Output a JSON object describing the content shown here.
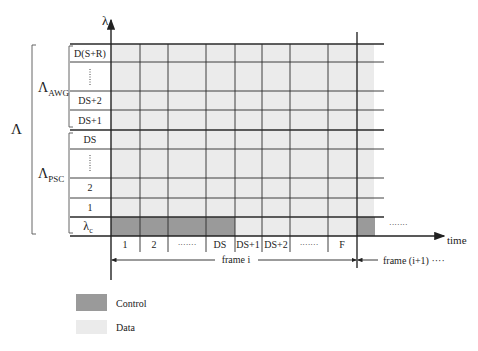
{
  "axes": {
    "y_label": "λ",
    "x_label": "time"
  },
  "groups": {
    "outer": "Λ",
    "awg": {
      "main": "Λ",
      "sub": "AWG"
    },
    "psc": {
      "main": "Λ",
      "sub": "PSC"
    }
  },
  "rows": [
    {
      "label": "D(S+R)",
      "dots": false
    },
    {
      "label": "",
      "dots": true
    },
    {
      "label": "DS+2",
      "dots": false
    },
    {
      "label": "DS+1",
      "dots": false
    },
    {
      "label": "DS",
      "dots": false
    },
    {
      "label": "",
      "dots": true
    },
    {
      "label": "2",
      "dots": false
    },
    {
      "label": "1",
      "dots": false
    },
    {
      "label": "λc",
      "main": "λ",
      "sub": "c",
      "dots": false
    }
  ],
  "columns": [
    {
      "label": "1"
    },
    {
      "label": "2"
    },
    {
      "label": "·······"
    },
    {
      "label": "DS"
    },
    {
      "label": "DS+1"
    },
    {
      "label": "DS+2"
    },
    {
      "label": "·······"
    },
    {
      "label": "F"
    }
  ],
  "frames": {
    "current": "frame i",
    "next": "frame (i+1) ····",
    "next_dots": "·······"
  },
  "legend": [
    {
      "label": "Control",
      "color": "#9a9a9a"
    },
    {
      "label": "Data",
      "color": "#ebebeb"
    }
  ],
  "colors": {
    "control": "#9a9a9a",
    "data": "#ebebeb",
    "grid": "#2a2a2a"
  }
}
